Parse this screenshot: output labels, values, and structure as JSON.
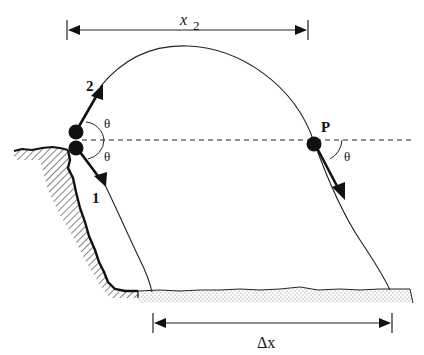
{
  "figure": {
    "type": "projectile-motion-diagram",
    "labels": {
      "ball_upper": "2",
      "ball_lower": "1",
      "point": "P",
      "angle_upper": "θ",
      "angle_lower": "θ",
      "angle_at_p": "θ",
      "top_distance_var": "x",
      "top_distance_sub": "2",
      "bottom_distance": "Δx"
    },
    "elements": {
      "cliff": "hatched-cliff-edge",
      "ground": "stippled-ground",
      "reference_line": "horizontal-dashed-line",
      "trajectory_2": "parabolic-arc-from-cliff-through-P-to-ground",
      "trajectory_1": "downward-path-from-cliff-to-ground"
    }
  },
  "colors": {
    "ink": "#111111",
    "hatch": "#333333",
    "stipple": "#777777",
    "background": "#ffffff"
  }
}
